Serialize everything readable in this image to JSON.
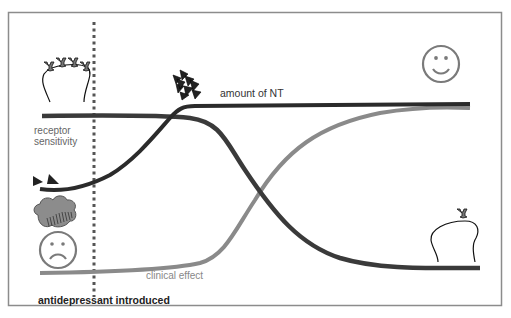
{
  "diagram": {
    "labels": {
      "amount_nt": "amount of NT",
      "receptor_sensitivity_line1": "receptor",
      "receptor_sensitivity_line2": "sensitivity",
      "clinical_effect": "clinical effect",
      "antidepressant_introduced": "antidepressant introduced"
    },
    "curves": [
      {
        "name": "amount of NT",
        "color": "#2b2b2b"
      },
      {
        "name": "receptor sensitivity",
        "color": "#3a3a3a"
      },
      {
        "name": "clinical effect",
        "color": "#8a8a8a"
      }
    ],
    "icons": [
      {
        "name": "neuron-many-receptors-icon"
      },
      {
        "name": "nt-cluster-icon"
      },
      {
        "name": "few-nt-triangles-icon"
      },
      {
        "name": "rain-cloud-icon"
      },
      {
        "name": "sad-face-icon"
      },
      {
        "name": "happy-face-icon"
      },
      {
        "name": "neuron-single-receptor-icon"
      }
    ],
    "colors": {
      "frame": "#8c8c8c",
      "dotted_marker": "#555555",
      "dark_curve": "#2e2e2e",
      "gray_curve": "#8a8a8a",
      "face": "#7a7a7a"
    }
  }
}
